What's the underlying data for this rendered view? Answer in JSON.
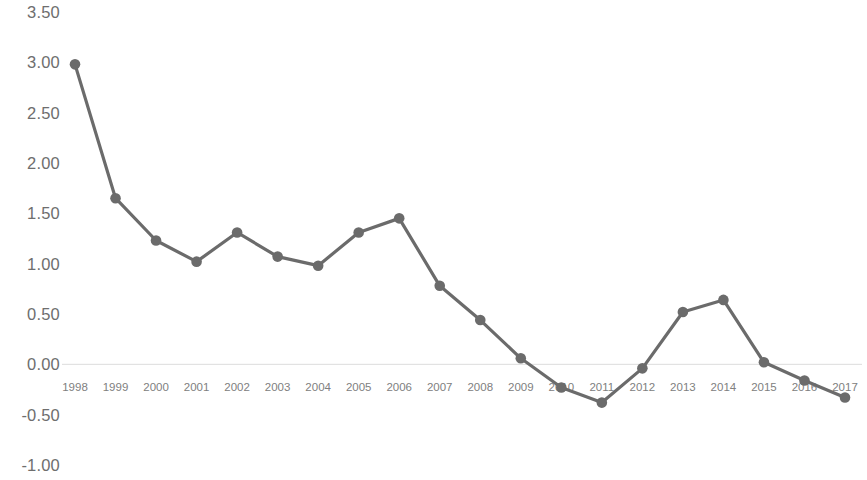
{
  "chart_data": {
    "type": "line",
    "title": "",
    "subtitle": "",
    "xlabel": "",
    "ylabel": "",
    "grid": false,
    "legend": null,
    "zero_line": true,
    "ylim": [
      -1.0,
      3.5
    ],
    "ytick_labels": [
      "3.50",
      "3.00",
      "2.50",
      "2.00",
      "1.50",
      "1.00",
      "0.50",
      "0.00",
      "-0.50",
      "-1.00"
    ],
    "ytick_values": [
      3.5,
      3.0,
      2.5,
      2.0,
      1.5,
      1.0,
      0.5,
      0.0,
      -0.5,
      -1.0
    ],
    "categories": [
      "1998",
      "1999",
      "2000",
      "2001",
      "2002",
      "2003",
      "2004",
      "2005",
      "2006",
      "2007",
      "2008",
      "2009",
      "2010",
      "2011",
      "2012",
      "2013",
      "2014",
      "2015",
      "2016",
      "2017"
    ],
    "values": [
      2.98,
      1.65,
      1.23,
      1.02,
      1.31,
      1.07,
      0.98,
      1.31,
      1.45,
      0.78,
      0.44,
      0.06,
      -0.23,
      -0.38,
      -0.04,
      0.52,
      0.64,
      0.02,
      -0.16,
      -0.33
    ],
    "series": [
      {
        "name": "series-1",
        "color": "#6b6b6b",
        "marker": "circle",
        "values": [
          2.98,
          1.65,
          1.23,
          1.02,
          1.31,
          1.07,
          0.98,
          1.31,
          1.45,
          0.78,
          0.44,
          0.06,
          -0.23,
          -0.38,
          -0.04,
          0.52,
          0.64,
          0.02,
          -0.16,
          -0.33
        ]
      }
    ],
    "colors": {
      "line": "#6b6b6b",
      "marker": "#6b6b6b",
      "axis_text": "#6e6e6e",
      "xtick_text": "#808080",
      "zero_line": "#dcdcdc",
      "background": "#ffffff"
    }
  }
}
